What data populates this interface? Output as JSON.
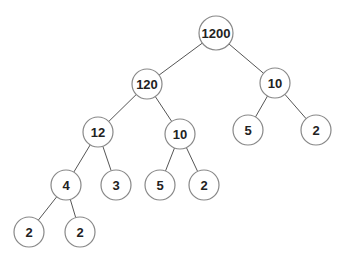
{
  "diagram": {
    "type": "factor-tree",
    "node_radius": 15,
    "nodes": [
      {
        "id": "n1200",
        "label": "1200",
        "x": 216,
        "y": 33,
        "r": 17
      },
      {
        "id": "n120",
        "label": "120",
        "x": 147,
        "y": 84,
        "r": 15
      },
      {
        "id": "n10r",
        "label": "10",
        "x": 275,
        "y": 83,
        "r": 15
      },
      {
        "id": "n12",
        "label": "12",
        "x": 98,
        "y": 132,
        "r": 15
      },
      {
        "id": "n10m",
        "label": "10",
        "x": 180,
        "y": 134,
        "r": 15
      },
      {
        "id": "n5r",
        "label": "5",
        "x": 248,
        "y": 130,
        "r": 15
      },
      {
        "id": "n2r",
        "label": "2",
        "x": 316,
        "y": 130,
        "r": 15
      },
      {
        "id": "n4",
        "label": "4",
        "x": 66,
        "y": 185,
        "r": 15
      },
      {
        "id": "n3",
        "label": "3",
        "x": 116,
        "y": 185,
        "r": 15
      },
      {
        "id": "n5m",
        "label": "5",
        "x": 160,
        "y": 185,
        "r": 15
      },
      {
        "id": "n2m",
        "label": "2",
        "x": 204,
        "y": 185,
        "r": 15
      },
      {
        "id": "n2ll",
        "label": "2",
        "x": 29,
        "y": 232,
        "r": 15
      },
      {
        "id": "n2lr",
        "label": "2",
        "x": 80,
        "y": 232,
        "r": 15
      }
    ],
    "edges": [
      [
        "n1200",
        "n120"
      ],
      [
        "n1200",
        "n10r"
      ],
      [
        "n120",
        "n12"
      ],
      [
        "n120",
        "n10m"
      ],
      [
        "n10r",
        "n5r"
      ],
      [
        "n10r",
        "n2r"
      ],
      [
        "n12",
        "n4"
      ],
      [
        "n12",
        "n3"
      ],
      [
        "n10m",
        "n5m"
      ],
      [
        "n10m",
        "n2m"
      ],
      [
        "n4",
        "n2ll"
      ],
      [
        "n4",
        "n2lr"
      ]
    ],
    "colors": {
      "edge": "#555555",
      "node_stroke": "#888888",
      "text": "#222222",
      "background": "#ffffff"
    }
  }
}
